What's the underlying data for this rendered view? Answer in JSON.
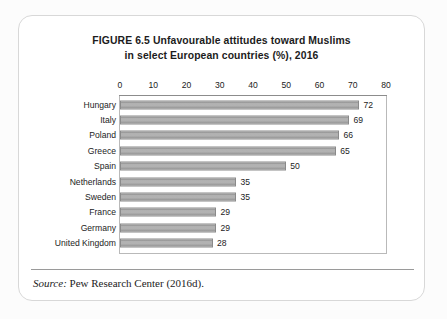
{
  "figure": {
    "title_line_1": "FIGURE 6.5  Unfavourable attitudes toward Muslims",
    "title_line_2": "in select European countries (%), 2016",
    "source_label": "Source:",
    "source_text": " Pew Research Center (2016d)."
  },
  "colors": {
    "bar_fill": "#b0b0b0",
    "bar_stroke": "#8a8a8a",
    "frame": "#b9b9b9",
    "text": "#1c1c1c",
    "card_border": "#d8d8d8",
    "card_background": "#ffffff",
    "page_background": "#fcfcfc"
  },
  "chart_data": {
    "type": "bar",
    "orientation": "horizontal",
    "title": "FIGURE 6.5  Unfavourable attitudes toward Muslims in select European countries (%), 2016",
    "xlabel": "",
    "ylabel": "",
    "xlim": [
      0,
      80
    ],
    "xticks": [
      0,
      10,
      20,
      30,
      40,
      50,
      60,
      70,
      80
    ],
    "xtick_labels": [
      "0",
      "10",
      "20",
      "30",
      "40",
      "50",
      "60",
      "70",
      "80"
    ],
    "grid": false,
    "legend": false,
    "data_labels": true,
    "categories": [
      "Hungary",
      "Italy",
      "Poland",
      "Greece",
      "Spain",
      "Netherlands",
      "Sweden",
      "France",
      "Germany",
      "United Kingdom"
    ],
    "values": [
      72,
      69,
      66,
      65,
      50,
      35,
      35,
      29,
      29,
      28
    ],
    "value_labels": [
      "72",
      "69",
      "66",
      "65",
      "50",
      "35",
      "35",
      "29",
      "29",
      "28"
    ],
    "units": "%",
    "source": "Pew Research Center (2016d)."
  }
}
